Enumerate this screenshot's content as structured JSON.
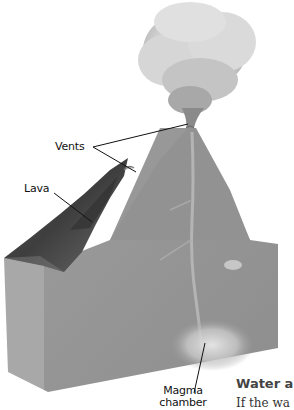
{
  "diagram": {
    "labels": {
      "vents": "Vents",
      "lava": "Lava",
      "magma_line1": "Magma",
      "magma_line2": "chamber"
    },
    "colors": {
      "block_front": "#9a9a9a",
      "block_left": "#a6a6a6",
      "cone": "#8f8f8f",
      "lava": "#4a4a4a",
      "smoke": "#d4d4d4",
      "magma_glow": "#d8d8d8",
      "leader_line": "#111111"
    }
  },
  "page_fragment": {
    "heading": "Water a",
    "body": "If the wa"
  }
}
